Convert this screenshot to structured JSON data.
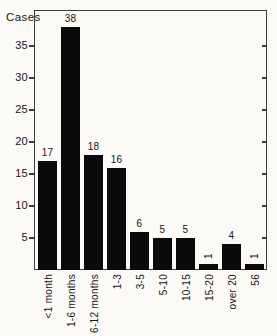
{
  "figure": {
    "background": "#fbfaf7",
    "bar_color": "#0b0b0b",
    "axis_color": "#3d3d3d",
    "text_color": "#161616"
  },
  "chart_data": {
    "type": "bar",
    "title": "",
    "xlabel": "",
    "ylabel": "Cases",
    "categories": [
      "<1 month",
      "1-6 months",
      "6-12 months",
      "1-3",
      "3-5",
      "5-10",
      "10-15",
      "15-20",
      "over 20",
      "56"
    ],
    "values": [
      17,
      38,
      18,
      16,
      6,
      5,
      5,
      1,
      4,
      1
    ],
    "bar_value_labels": [
      "17",
      "38",
      "18",
      "16",
      "6",
      "5",
      "5",
      "1",
      "4",
      "1"
    ],
    "rotated_bar_label_indices": [
      7,
      9
    ],
    "yticks": [
      5,
      10,
      15,
      20,
      25,
      30,
      35
    ],
    "ylim": [
      0,
      40.6
    ],
    "grid": "off",
    "legend": "none",
    "frame": "closed box with inward ticks on right axis, outward ticks on left axis",
    "x_tick_label_rotation_deg": 90
  }
}
